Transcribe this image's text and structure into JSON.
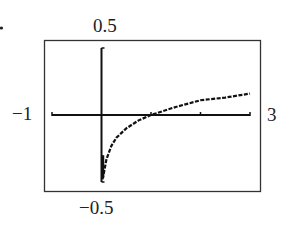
{
  "chart_data": {
    "type": "line",
    "title": "",
    "xlabel": "",
    "ylabel": "",
    "xlim": [
      -1,
      3
    ],
    "ylim": [
      -0.5,
      0.5
    ],
    "grid": false,
    "legend": null,
    "tick_labels": {
      "x_min": "−1",
      "x_max": "3",
      "y_max": "0.5",
      "y_min": "−0.5"
    },
    "x_ticks": [
      -1,
      1,
      2,
      3
    ],
    "series": [
      {
        "name": "f(x)",
        "style": "dotted-pixel",
        "x": [
          0.02,
          0.05,
          0.1,
          0.2,
          0.3,
          0.5,
          0.75,
          1.0,
          1.5,
          2.0,
          2.5,
          3.0
        ],
        "y": [
          -0.48,
          -0.43,
          -0.33,
          -0.23,
          -0.17,
          -0.1,
          -0.04,
          0.0,
          0.06,
          0.11,
          0.13,
          0.16
        ]
      }
    ],
    "annotations": [
      "viewing window: [-1, 3] by [-0.5, 0.5]"
    ]
  },
  "labels": {
    "x_min": "−1",
    "x_max": "3",
    "y_max": "0.5",
    "y_min": "−0.5"
  },
  "colors": {
    "axis": "#111111",
    "frame": "#333333",
    "curve": "#111111"
  }
}
